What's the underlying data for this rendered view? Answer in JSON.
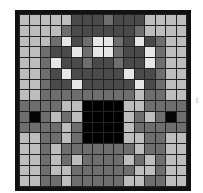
{
  "palette": {
    "W": "#e6e6e6",
    "L": "#bdbdbd",
    "M": "#6e6e6e",
    "D": "#4a4a4a",
    "K": "#000000",
    "B": "#050505"
  },
  "grid": {
    "rows": 16,
    "cols": 16,
    "cells": [
      "LLLLLDDDMDDDLLLL",
      "LLLLMDDDDDDMLLLL",
      "LLLMWDMWWMDWDMLL",
      "LLMDDWMWWMDDWMLL",
      "LLMWDDMDDMDDWMLL",
      "LLMDWDDDDDWDDMLL",
      "LLMDDWDDDDDWDMLL",
      "LLMMMMMMMMMLMMLL",
      "MMMMLLKKKKLLMMMM",
      "MBMLMLKKKKLMLMBM",
      "MMMMLMKKKKLMMMMM",
      "LLMMLMKKKKLLMMLL",
      "LLMLMMMMMMMLMMLL",
      "LLMLMLMMMMLMLMLL",
      "LLMLLMMMMMMLLMLL",
      "LLMMLMMMMMLLMMLL"
    ]
  },
  "side_mark": "ℓ"
}
